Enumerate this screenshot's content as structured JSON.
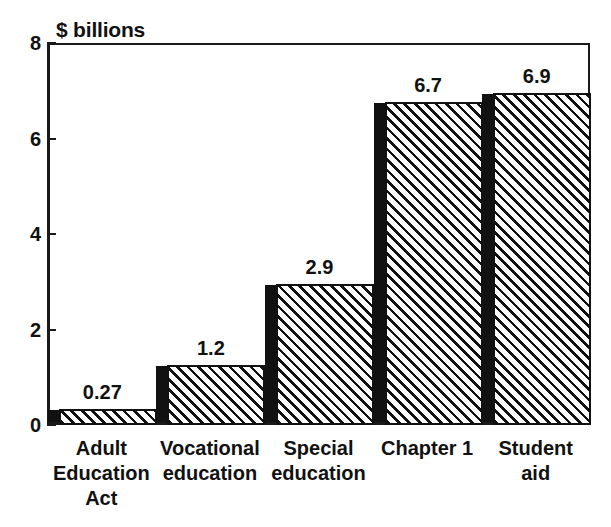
{
  "chart_data": {
    "type": "bar",
    "title": "",
    "subtitle": "",
    "xlabel": "",
    "ylabel": "$ billions",
    "ylim": [
      0,
      8
    ],
    "yticks": [
      0,
      2,
      4,
      6,
      8
    ],
    "ytick_labels": [
      "0",
      "2",
      "4",
      "6",
      "8"
    ],
    "grid": false,
    "legend": null,
    "categories": [
      "Adult Education Act",
      "Vocational education",
      "Special education",
      "Chapter 1",
      "Student aid"
    ],
    "category_lines": [
      [
        "Adult",
        "Education",
        "Act"
      ],
      [
        "Vocational",
        "education"
      ],
      [
        "Special",
        "education"
      ],
      [
        "Chapter 1"
      ],
      [
        "Student",
        "aid"
      ]
    ],
    "values": [
      0.27,
      1.2,
      2.9,
      6.7,
      6.9
    ],
    "value_labels": [
      "0.27",
      "1.2",
      "2.9",
      "6.7",
      "6.9"
    ],
    "bar_style": {
      "fill": "diagonal-hatch",
      "hatch_color": "#111111",
      "body_color": "#ffffff",
      "side_face_color": "#111111",
      "outline_color": "#111111",
      "three_d": true
    },
    "colors": {
      "axis": "#1a1a1a",
      "text": "#111111",
      "background": "#ffffff"
    }
  },
  "axis": {
    "title": "$ billions"
  }
}
